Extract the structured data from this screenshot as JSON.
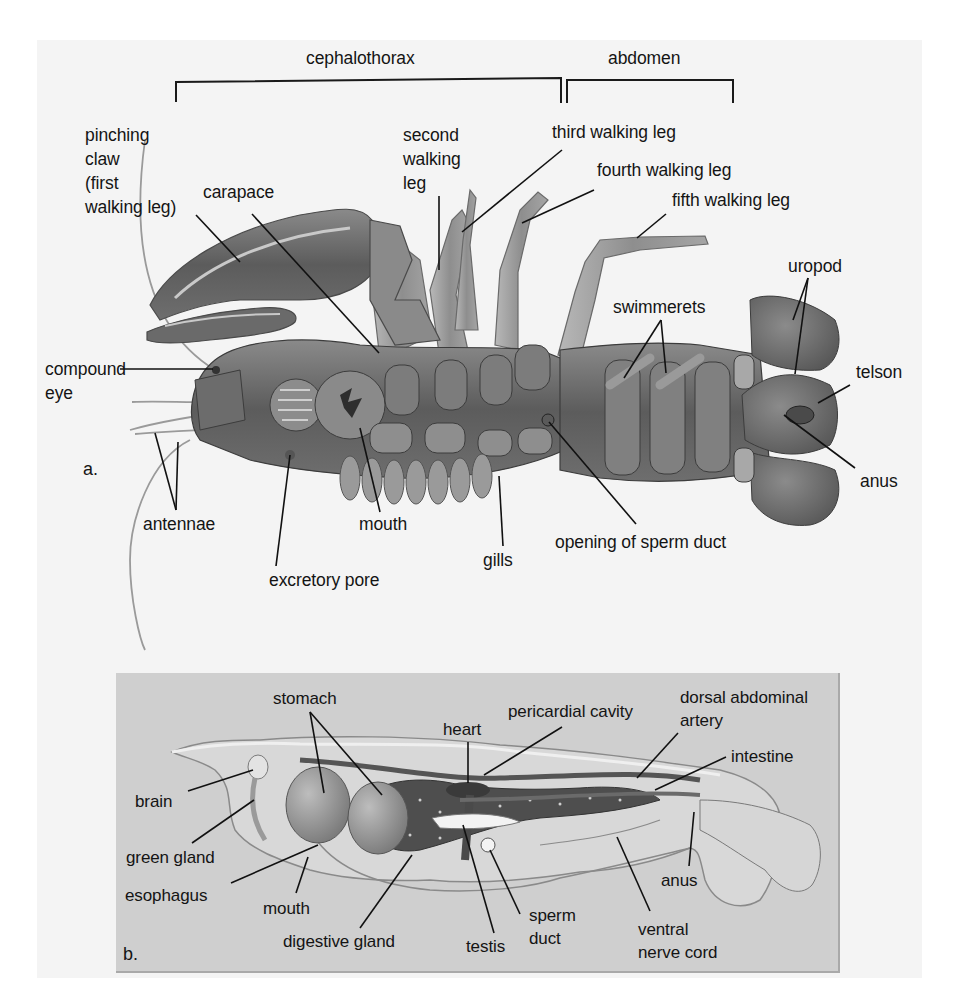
{
  "figure": {
    "background": "#f4f4f4",
    "panel_b_background": "#cfcfcf",
    "ink": "#141414"
  },
  "panel_a": {
    "letter": "a.",
    "title": "External anatomy of crayfish (ventral view)",
    "regions": [
      {
        "label": "cephalothorax",
        "bracket": [
          176,
          563
        ]
      },
      {
        "label": "abdomen",
        "bracket": [
          567,
          733
        ]
      }
    ],
    "labels": [
      {
        "id": "pinching-claw",
        "text": "pinching\nclaw\n(first\nwalking leg)",
        "x": 85,
        "y": 123
      },
      {
        "id": "carapace",
        "text": "carapace",
        "x": 203,
        "y": 178
      },
      {
        "id": "second-walking-leg",
        "text": "second\nwalking\nleg",
        "x": 403,
        "y": 123
      },
      {
        "id": "third-walking-leg",
        "text": "third walking leg",
        "x": 552,
        "y": 123
      },
      {
        "id": "fourth-walking-leg",
        "text": "fourth walking leg",
        "x": 597,
        "y": 160
      },
      {
        "id": "fifth-walking-leg",
        "text": "fifth walking leg",
        "x": 672,
        "y": 190
      },
      {
        "id": "uropod",
        "text": "uropod",
        "x": 788,
        "y": 256
      },
      {
        "id": "swimmerets",
        "text": "swimmerets",
        "x": 613,
        "y": 297
      },
      {
        "id": "compound-eye",
        "text": "compound\neye",
        "x": 45,
        "y": 356
      },
      {
        "id": "telson",
        "text": "telson",
        "x": 856,
        "y": 360
      },
      {
        "id": "antennae",
        "text": "antennae",
        "x": 143,
        "y": 514
      },
      {
        "id": "mouth",
        "text": "mouth",
        "x": 359,
        "y": 514
      },
      {
        "id": "anus",
        "text": "anus",
        "x": 860,
        "y": 471
      },
      {
        "id": "gills",
        "text": "gills",
        "x": 483,
        "y": 550
      },
      {
        "id": "opening-of-sperm-duct",
        "text": "opening of sperm duct",
        "x": 555,
        "y": 532
      },
      {
        "id": "excretory-pore",
        "text": "excretory pore",
        "x": 269,
        "y": 570
      }
    ]
  },
  "panel_b": {
    "letter": "b.",
    "title": "Internal anatomy of crayfish (lateral view)",
    "labels": [
      {
        "id": "stomach",
        "text": "stomach",
        "x": 273,
        "y": 688
      },
      {
        "id": "heart",
        "text": "heart",
        "x": 443,
        "y": 719
      },
      {
        "id": "pericardial-cavity",
        "text": "pericardial cavity",
        "x": 508,
        "y": 700
      },
      {
        "id": "dorsal-abdominal-artery",
        "text": "dorsal abdominal\nartery",
        "x": 680,
        "y": 686
      },
      {
        "id": "intestine",
        "text": "intestine",
        "x": 731,
        "y": 746
      },
      {
        "id": "brain",
        "text": "brain",
        "x": 135,
        "y": 791
      },
      {
        "id": "green-gland",
        "text": "green gland",
        "x": 126,
        "y": 846
      },
      {
        "id": "esophagus",
        "text": "esophagus",
        "x": 125,
        "y": 884
      },
      {
        "id": "mouth-b",
        "text": "mouth",
        "x": 263,
        "y": 897
      },
      {
        "id": "anus-b",
        "text": "anus",
        "x": 661,
        "y": 869
      },
      {
        "id": "sperm-duct",
        "text": "sperm\nduct",
        "x": 529,
        "y": 904
      },
      {
        "id": "ventral-nerve-cord",
        "text": "ventral\nnerve cord",
        "x": 638,
        "y": 918
      },
      {
        "id": "digestive-gland",
        "text": "digestive gland",
        "x": 283,
        "y": 930
      },
      {
        "id": "testis",
        "text": "testis",
        "x": 466,
        "y": 935
      }
    ]
  }
}
